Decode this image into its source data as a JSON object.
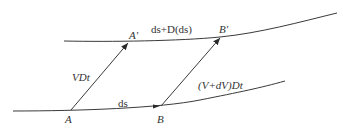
{
  "diagram": {
    "type": "fluid-element-kinematics",
    "colors": {
      "line": "#3a3a3a",
      "text": "#333333",
      "background": "#ffffff"
    },
    "curves": {
      "lower": {
        "label": "ds",
        "points": [
          "A",
          "B"
        ]
      },
      "upper": {
        "label": "ds+D(ds)",
        "points": [
          "A'",
          "B'"
        ]
      }
    },
    "vectors": [
      {
        "from": "A",
        "to": "A'",
        "label": "VDt"
      },
      {
        "from": "B",
        "to": "B'",
        "label": "(V+dV)Dt"
      }
    ],
    "labels": {
      "A": "A",
      "B": "B",
      "A_prime": "A'",
      "B_prime": "B'",
      "ds": "ds",
      "ds_plus_Dds": "ds+D(ds)",
      "VDt": "VDt",
      "V_dV_Dt": "(V+dV)Dt"
    }
  }
}
